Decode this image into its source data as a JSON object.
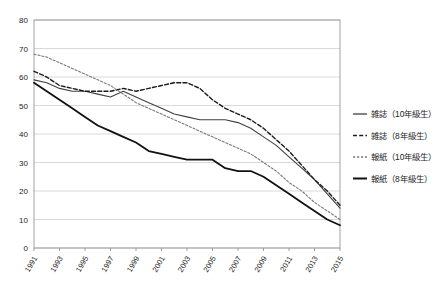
{
  "chart_data": {
    "type": "line",
    "title": "",
    "subtitle": "",
    "xlabel": "",
    "ylabel": "",
    "grid": true,
    "legend_position": "right",
    "xlim": [
      1991,
      2015
    ],
    "ylim": [
      0,
      80
    ],
    "ytick_labels": [
      "0",
      "10",
      "20",
      "30",
      "40",
      "50",
      "60",
      "70",
      "80"
    ],
    "ytick_values": [
      0,
      10,
      20,
      30,
      40,
      50,
      60,
      70,
      80
    ],
    "xtick_labels": [
      "1991",
      "1993",
      "1995",
      "1997",
      "1999",
      "2001",
      "2003",
      "2005",
      "2007",
      "2009",
      "2011",
      "2013",
      "2015"
    ],
    "xtick_values": [
      1991,
      1993,
      1995,
      1997,
      1999,
      2001,
      2003,
      2005,
      2007,
      2009,
      2011,
      2013,
      2015
    ],
    "x": [
      1991,
      1992,
      1993,
      1994,
      1995,
      1996,
      1997,
      1998,
      1999,
      2000,
      2001,
      2002,
      2003,
      2004,
      2005,
      2006,
      2007,
      2008,
      2009,
      2010,
      2011,
      2012,
      2013,
      2014,
      2015
    ],
    "series": [
      {
        "name": "雑誌（10年級生）",
        "style": "solid",
        "color": "#404040",
        "width": 1.1,
        "values": [
          59,
          58,
          56,
          55,
          55,
          54,
          53,
          55,
          53,
          51,
          49,
          47,
          46,
          45,
          45,
          45,
          44,
          42,
          39,
          36,
          32,
          28,
          24,
          19,
          14
        ]
      },
      {
        "name": "雑誌（8年級生）",
        "style": "dashed",
        "color": "#1c1c1c",
        "width": 1.4,
        "values": [
          62,
          60,
          57,
          56,
          55,
          55,
          55,
          56,
          55,
          56,
          57,
          58,
          58,
          56,
          52,
          49,
          47,
          45,
          42,
          38,
          34,
          29,
          24,
          20,
          15
        ]
      },
      {
        "name": "報紙（10年級生）",
        "style": "dotted",
        "color": "#7a7a7a",
        "width": 1.1,
        "values": [
          68,
          67,
          65,
          63,
          61,
          59,
          57,
          54,
          51,
          49,
          47,
          45,
          43,
          41,
          39,
          37,
          35,
          33,
          30,
          27,
          23,
          20,
          16,
          13,
          10
        ]
      },
      {
        "name": "報紙（8年級生）",
        "style": "solid",
        "color": "#111111",
        "width": 1.8,
        "values": [
          58,
          55,
          52,
          49,
          46,
          43,
          41,
          39,
          37,
          34,
          33,
          32,
          31,
          31,
          31,
          28,
          27,
          27,
          25,
          22,
          19,
          16,
          13,
          10,
          8
        ]
      }
    ]
  },
  "legend": {
    "items": [
      {
        "label": "雑誌（10年級生）",
        "style": "solid"
      },
      {
        "label": "雑誌（8年級生）",
        "style": "dashed"
      },
      {
        "label": "報紙（10年級生）",
        "style": "dotted"
      },
      {
        "label": "報紙（8年級生）",
        "style": "solid-thick"
      }
    ]
  }
}
